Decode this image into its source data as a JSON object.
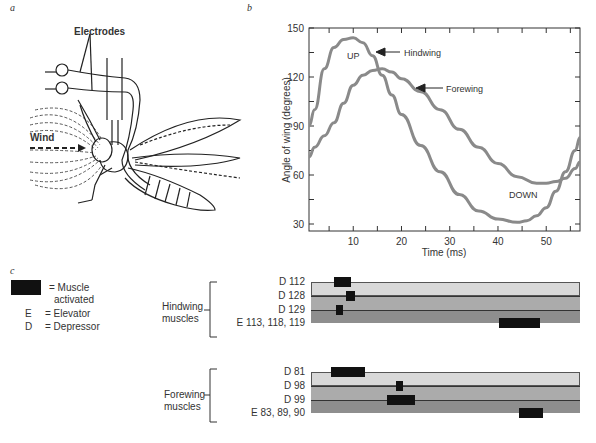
{
  "panels": {
    "a": "a",
    "b": "b",
    "c": "c"
  },
  "illustration": {
    "labels": {
      "electrodes": "Electrodes",
      "wind": "Wind"
    }
  },
  "chart_data": [
    {
      "type": "line",
      "title": "",
      "xlabel": "Time (ms)",
      "ylabel": "Angle of wing (degrees)",
      "xlim": [
        0,
        57
      ],
      "ylim": [
        20,
        150
      ],
      "xticks": [
        10,
        20,
        30,
        40,
        50
      ],
      "yticks": [
        30,
        60,
        90,
        120,
        150
      ],
      "grid": false,
      "series": [
        {
          "name": "Hindwing",
          "x": [
            0,
            2,
            4,
            6,
            8,
            10,
            12,
            14,
            16,
            18,
            20,
            24,
            28,
            32,
            36,
            40,
            44,
            46,
            48,
            50,
            52,
            54,
            56,
            57
          ],
          "values": [
            90,
            100,
            125,
            138,
            143,
            144,
            141,
            133,
            121,
            109,
            97,
            78,
            62,
            48,
            38,
            33,
            31,
            32,
            35,
            40,
            50,
            62,
            75,
            83
          ]
        },
        {
          "name": "Forewing",
          "x": [
            0,
            2,
            4,
            6,
            8,
            10,
            12,
            14,
            16,
            18,
            20,
            24,
            28,
            32,
            36,
            40,
            44,
            48,
            50,
            52,
            54,
            56,
            57
          ],
          "values": [
            71,
            77,
            84,
            92,
            104,
            115,
            121,
            124,
            125,
            123,
            119,
            111,
            100,
            88,
            77,
            67,
            59,
            55,
            55,
            56,
            58,
            64,
            68
          ]
        }
      ],
      "annotations": [
        {
          "text": "UP",
          "x": 10,
          "y": 134
        },
        {
          "text": "DOWN",
          "x": 46,
          "y": 40
        },
        {
          "text": "Hindwing",
          "arrow_to": [
            14,
            134
          ]
        },
        {
          "text": "Forewing",
          "arrow_to": [
            23,
            112
          ]
        }
      ]
    },
    {
      "type": "heatmap",
      "title": "Muscle activation timing",
      "legend": {
        "activated": "= Muscle",
        "activated2": "activated",
        "E": "E",
        "E_text": "= Elevator",
        "D": "D",
        "D_text": "= Depressor"
      },
      "groups": [
        {
          "name": "Hindwing muscles",
          "label1": "Hindwing",
          "label2": "muscles",
          "rows": [
            {
              "label": "D 112",
              "active_ms": [
                [
                  6,
                  9.5
                ]
              ]
            },
            {
              "label": "D 128",
              "active_ms": [
                [
                  8.5,
                  10.5
                ]
              ]
            },
            {
              "label": "D 129",
              "active_ms": [
                [
                  6.5,
                  8
                ]
              ]
            },
            {
              "label": "E 113, 118, 119",
              "active_ms": [
                [
                  40.5,
                  49
                ]
              ]
            }
          ]
        },
        {
          "name": "Forewing muscles",
          "label1": "Forewing",
          "label2": "muscles",
          "rows": [
            {
              "label": "D 81",
              "active_ms": [
                [
                  5.5,
                  12.5
                ]
              ]
            },
            {
              "label": "D 98",
              "active_ms": [
                [
                  19,
                  20.5
                ]
              ]
            },
            {
              "label": "D 99",
              "active_ms": [
                [
                  17,
                  23
                ]
              ]
            },
            {
              "label": "E 83, 89, 90",
              "active_ms": [
                [
                  44.5,
                  49.5
                ]
              ]
            }
          ]
        }
      ],
      "band_colors": [
        "#d8d8d8",
        "#ababab",
        "#8e8e8e",
        "#7e7e7e"
      ]
    }
  ]
}
